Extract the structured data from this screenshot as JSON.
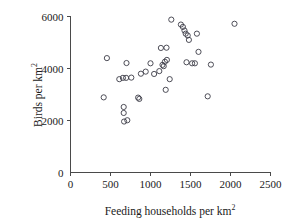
{
  "chart_data": {
    "type": "scatter",
    "title": "",
    "xlabel": "Feeding households per km2",
    "ylabel": "Birds per km2",
    "xlabel_base": "Feeding households per km",
    "xlabel_exponent": "2",
    "ylabel_base": "Birds per km",
    "ylabel_exponent": "2",
    "xlim": [
      0,
      2500
    ],
    "ylim": [
      0,
      6000
    ],
    "xticks": [
      0,
      500,
      1000,
      1500,
      2000,
      2500
    ],
    "yticks": [
      0,
      2000,
      4000,
      6000
    ],
    "xtick_labels": [
      "0",
      "500",
      "1000",
      "1500",
      "2000",
      "2500"
    ],
    "ytick_labels": [
      "0",
      "2000",
      "4000",
      "6000"
    ],
    "grid": false,
    "legend": null,
    "marker": "open-circle",
    "marker_color": "#3b3b46",
    "n_points": 43,
    "points": [
      {
        "x": 415,
        "y": 2890
      },
      {
        "x": 455,
        "y": 4400
      },
      {
        "x": 610,
        "y": 3590
      },
      {
        "x": 655,
        "y": 3640
      },
      {
        "x": 665,
        "y": 2520
      },
      {
        "x": 665,
        "y": 2290
      },
      {
        "x": 670,
        "y": 1960
      },
      {
        "x": 695,
        "y": 3640
      },
      {
        "x": 700,
        "y": 4210
      },
      {
        "x": 710,
        "y": 2010
      },
      {
        "x": 760,
        "y": 3650
      },
      {
        "x": 845,
        "y": 2880
      },
      {
        "x": 860,
        "y": 2830
      },
      {
        "x": 880,
        "y": 3800
      },
      {
        "x": 940,
        "y": 3880
      },
      {
        "x": 1000,
        "y": 4200
      },
      {
        "x": 1045,
        "y": 3790
      },
      {
        "x": 1110,
        "y": 3900
      },
      {
        "x": 1130,
        "y": 4790
      },
      {
        "x": 1150,
        "y": 4140
      },
      {
        "x": 1165,
        "y": 4090
      },
      {
        "x": 1180,
        "y": 4260
      },
      {
        "x": 1190,
        "y": 3180
      },
      {
        "x": 1200,
        "y": 4800
      },
      {
        "x": 1205,
        "y": 4330
      },
      {
        "x": 1240,
        "y": 3590
      },
      {
        "x": 1260,
        "y": 5880
      },
      {
        "x": 1380,
        "y": 5690
      },
      {
        "x": 1405,
        "y": 5600
      },
      {
        "x": 1425,
        "y": 5460
      },
      {
        "x": 1440,
        "y": 5340
      },
      {
        "x": 1450,
        "y": 4240
      },
      {
        "x": 1465,
        "y": 5270
      },
      {
        "x": 1480,
        "y": 5100
      },
      {
        "x": 1520,
        "y": 4200
      },
      {
        "x": 1555,
        "y": 4200
      },
      {
        "x": 1580,
        "y": 5340
      },
      {
        "x": 1600,
        "y": 4640
      },
      {
        "x": 1715,
        "y": 2930
      },
      {
        "x": 1755,
        "y": 4150
      },
      {
        "x": 2050,
        "y": 5720
      }
    ]
  },
  "axes": {
    "x_axis_name": "x-axis",
    "y_axis_name": "y-axis"
  }
}
